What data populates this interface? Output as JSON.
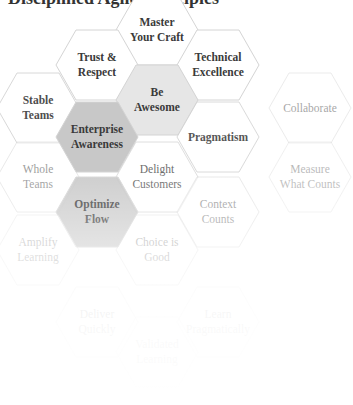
{
  "title": "Disciplined Agile Principles",
  "colors": {
    "hex_stroke": "#d4d4d4",
    "hex_fill_white": "#ffffff",
    "hex_fill_light_gray": "#e6e6e6",
    "hex_fill_gray": "#c8c8c8",
    "text_dark": "#3a3a3a"
  },
  "hexagons": [
    {
      "id": "master-your-craft",
      "label_line1": "Master",
      "label_line2": "Your Craft",
      "cx": 157,
      "cy": 30,
      "fill": "white",
      "opacity": 1
    },
    {
      "id": "trust-respect",
      "label_line1": "Trust &",
      "label_line2": "Respect",
      "cx": 97,
      "cy": 65,
      "fill": "white",
      "opacity": 1
    },
    {
      "id": "technical-excellence",
      "label_line1": "Technical",
      "label_line2": "Excellence",
      "cx": 218,
      "cy": 65,
      "fill": "white",
      "opacity": 1
    },
    {
      "id": "be-awesome",
      "label_line1": "Be",
      "label_line2": "Awesome",
      "cx": 157,
      "cy": 100,
      "fill": "light_gray",
      "opacity": 1
    },
    {
      "id": "stable-teams",
      "label_line1": "Stable",
      "label_line2": "Teams",
      "cx": 38,
      "cy": 108,
      "fill": "white",
      "opacity": 0.9
    },
    {
      "id": "collaborate",
      "label_line1": "Collaborate",
      "label_line2": "",
      "cx": 310,
      "cy": 108,
      "fill": "white",
      "opacity": 0.45
    },
    {
      "id": "enterprise-awareness",
      "label_line1": "Enterprise",
      "label_line2": "Awareness",
      "cx": 97,
      "cy": 137,
      "fill": "gray",
      "opacity": 1
    },
    {
      "id": "pragmatism",
      "label_line1": "Pragmatism",
      "label_line2": "",
      "cx": 218,
      "cy": 137,
      "fill": "white",
      "opacity": 0.85
    },
    {
      "id": "whole-teams",
      "label_line1": "Whole",
      "label_line2": "Teams",
      "cx": 38,
      "cy": 177,
      "fill": "white",
      "opacity": 0.5
    },
    {
      "id": "delight-customers",
      "label_line1": "Delight",
      "label_line2": "Customers",
      "cx": 157,
      "cy": 177,
      "fill": "white",
      "opacity": 0.75
    },
    {
      "id": "measure-what-counts",
      "label_line1": "Measure",
      "label_line2": "What Counts",
      "cx": 310,
      "cy": 177,
      "fill": "white",
      "opacity": 0.35
    },
    {
      "id": "optimize-flow",
      "label_line1": "Optimize",
      "label_line2": "Flow",
      "cx": 97,
      "cy": 212,
      "fill": "gray",
      "opacity": 0.9
    },
    {
      "id": "context-counts",
      "label_line1": "Context",
      "label_line2": "Counts",
      "cx": 218,
      "cy": 212,
      "fill": "white",
      "opacity": 0.5
    },
    {
      "id": "amplify-learning",
      "label_line1": "Amplify",
      "label_line2": "Learning",
      "cx": 38,
      "cy": 250,
      "fill": "white",
      "opacity": 0.35
    },
    {
      "id": "choice-is-good",
      "label_line1": "Choice is",
      "label_line2": "Good",
      "cx": 157,
      "cy": 250,
      "fill": "white",
      "opacity": 0.4
    },
    {
      "id": "deliver",
      "label_line1": "Deliver",
      "label_line2": "Quickly",
      "cx": 97,
      "cy": 322,
      "fill": "white",
      "opacity": 0.25
    },
    {
      "id": "learn",
      "label_line1": "Learn",
      "label_line2": "Pragmatically",
      "cx": 218,
      "cy": 322,
      "fill": "white",
      "opacity": 0.2
    },
    {
      "id": "validated-learning",
      "label_line1": "Validated",
      "label_line2": "Learning",
      "cx": 157,
      "cy": 352,
      "fill": "white",
      "opacity": 0.2
    }
  ]
}
